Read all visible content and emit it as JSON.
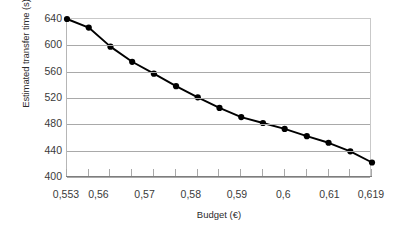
{
  "chart_data": {
    "type": "line",
    "title": "",
    "xlabel": "Budget (€)",
    "ylabel": "Estimated transfer time (s)",
    "xlim": [
      0.553,
      0.619
    ],
    "ylim": [
      400,
      640
    ],
    "grid": true,
    "legend": null,
    "marker": "filled-circle",
    "line_color": "#000000",
    "marker_color": "#000000",
    "grid_color": "#a9a9a9",
    "x_tick_labels": [
      "0,553",
      "0,56",
      "0,57",
      "0,58",
      "0,59",
      "0,6",
      "0,61",
      "0,619"
    ],
    "x_tick_values": [
      0.553,
      0.56,
      0.57,
      0.58,
      0.59,
      0.6,
      0.61,
      0.619
    ],
    "y_tick_labels": [
      "400",
      "440",
      "480",
      "520",
      "560",
      "600",
      "640"
    ],
    "y_tick_values": [
      400,
      440,
      480,
      520,
      560,
      600,
      640
    ],
    "x": [
      0.553,
      0.5577,
      0.5624,
      0.5671,
      0.5718,
      0.5766,
      0.5813,
      0.586,
      0.5907,
      0.5954,
      0.6001,
      0.6049,
      0.6096,
      0.6143,
      0.619
    ],
    "values": [
      640,
      627,
      598,
      575,
      557,
      538,
      521,
      505,
      491,
      482,
      473,
      462,
      452,
      439,
      422
    ],
    "series": [
      {
        "name": "Estimated transfer time",
        "values": [
          640,
          627,
          598,
          575,
          557,
          538,
          521,
          505,
          491,
          482,
          473,
          462,
          452,
          439,
          422
        ]
      }
    ],
    "n_points": 15
  }
}
